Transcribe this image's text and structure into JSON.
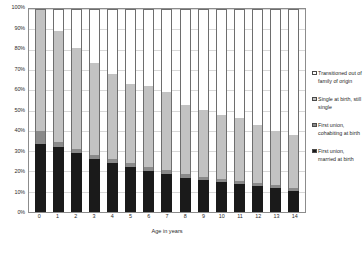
{
  "chart_data": {
    "type": "bar",
    "stacked": true,
    "stack_total": 100,
    "title": "",
    "xlabel": "Age in years",
    "ylabel": "",
    "ylim": [
      0,
      100
    ],
    "yticks": [
      "0%",
      "10%",
      "20%",
      "30%",
      "40%",
      "50%",
      "60%",
      "70%",
      "80%",
      "90%",
      "100%"
    ],
    "ytick_values": [
      0,
      10,
      20,
      30,
      40,
      50,
      60,
      70,
      80,
      90,
      100
    ],
    "grid": true,
    "legend_position": "right",
    "categories": [
      "0",
      "1",
      "2",
      "3",
      "4",
      "5",
      "6",
      "7",
      "8",
      "9",
      "10",
      "11",
      "12",
      "13",
      "14"
    ],
    "series": [
      {
        "name": "First union, married at birth",
        "color": "#1a1a1a",
        "values": [
          33.5,
          32.0,
          29.0,
          26.0,
          24.0,
          22.0,
          20.0,
          18.5,
          17.0,
          16.0,
          15.0,
          14.0,
          13.0,
          12.0,
          10.5
        ]
      },
      {
        "name": "First union, cohabiting at birth",
        "color": "#8a8a8a",
        "values": [
          6.5,
          2.5,
          2.0,
          2.0,
          2.0,
          2.0,
          2.0,
          2.0,
          1.5,
          1.5,
          1.5,
          1.5,
          1.5,
          1.5,
          1.5
        ]
      },
      {
        "name": "Single at birth, still single",
        "color": "#c2c2c2",
        "values": [
          60.0,
          54.5,
          50.0,
          45.5,
          42.0,
          39.0,
          40.0,
          38.5,
          34.0,
          33.0,
          31.5,
          31.0,
          28.5,
          26.5,
          26.0
        ]
      },
      {
        "name": "Transitioned out of family of origin",
        "color": "#ffffff",
        "values": [
          0.0,
          11.0,
          19.0,
          26.5,
          32.0,
          37.0,
          38.0,
          41.0,
          47.5,
          49.5,
          52.0,
          53.5,
          57.0,
          60.0,
          62.0
        ]
      }
    ],
    "bar_tops": [
      100,
      89,
      81,
      73.5,
      68,
      63,
      62,
      59,
      52.5,
      50.5,
      48,
      46.5,
      43,
      40,
      38
    ]
  },
  "legend": {
    "items": [
      {
        "label": "Transitioned out of family of origin",
        "swatch": "sw-trans"
      },
      {
        "label": "Single at birth, still single",
        "swatch": "sw-single"
      },
      {
        "label": "First union, cohabiting at birth",
        "swatch": "sw-cohab"
      },
      {
        "label": "First union, married at birth",
        "swatch": "sw-married"
      }
    ]
  }
}
